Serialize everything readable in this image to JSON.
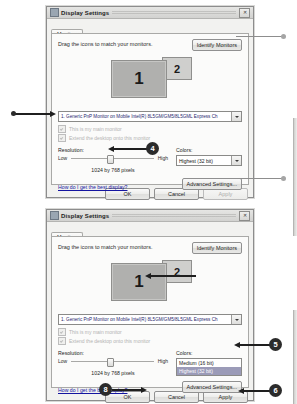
{
  "window": {
    "title": "Display Settings",
    "icon": "display-icon",
    "close_label": "✕"
  },
  "tabs": [
    {
      "label": "Monitor"
    }
  ],
  "dialog_top": {
    "hint": "Drag the icons to match your monitors.",
    "identify_button": "Identify Monitors",
    "monitors": [
      {
        "number": "1",
        "selected": true
      },
      {
        "number": "2",
        "selected": false
      }
    ],
    "monitor_select": "1. Generic PnP Monitor on Mobile Intel(R) 8L5GM/GM5/8L5GML Express Ch",
    "checkboxes": [
      {
        "label": "This is my main monitor",
        "checked": true,
        "enabled": false
      },
      {
        "label": "Extend the desktop onto this monitor",
        "checked": true,
        "enabled": false
      }
    ],
    "resolution_label": "Resolution:",
    "slider_low": "Low",
    "slider_high": "High",
    "resolution_value": "1024 by 768 pixels",
    "colors_label": "Colors:",
    "colors_value": "Highest (32 bit)",
    "help_link": "How do I get the best display?",
    "advanced_button": "Advanced Settings...",
    "footer_buttons": [
      {
        "label": "OK",
        "enabled": true
      },
      {
        "label": "Cancel",
        "enabled": true
      },
      {
        "label": "Apply",
        "enabled": false
      }
    ]
  },
  "dialog_bottom": {
    "hint": "Drag the icons to match your monitors.",
    "identify_button": "Identify Monitors",
    "monitors": [
      {
        "number": "1",
        "selected": true
      },
      {
        "number": "2",
        "selected": false
      }
    ],
    "monitor_select": "1. Generic PnP Monitor on Mobile Intel(R) 8L5GM/GM5/8L5GML Express Ch",
    "checkboxes": [
      {
        "label": "This is my main monitor",
        "checked": true,
        "enabled": false
      },
      {
        "label": "Extend the desktop onto this monitor",
        "checked": true,
        "enabled": false
      }
    ],
    "resolution_label": "Resolution:",
    "slider_low": "Low",
    "slider_high": "High",
    "resolution_value": "1024 by 768 pixels",
    "colors_label": "Colors:",
    "colors_value": "Highest (32 bit)",
    "colors_options": [
      {
        "label": "Medium (16 bit)",
        "selected": false
      },
      {
        "label": "Highest (32 bit)",
        "selected": true
      }
    ],
    "help_link": "How do I get the best display?",
    "advanced_button": "Advanced Settings...",
    "footer_buttons": [
      {
        "label": "OK",
        "enabled": true
      },
      {
        "label": "Cancel",
        "enabled": true
      },
      {
        "label": "Apply",
        "enabled": true
      }
    ]
  },
  "callouts": [
    {
      "number": "4"
    },
    {
      "number": "5"
    },
    {
      "number": "6"
    },
    {
      "number": "8"
    }
  ]
}
